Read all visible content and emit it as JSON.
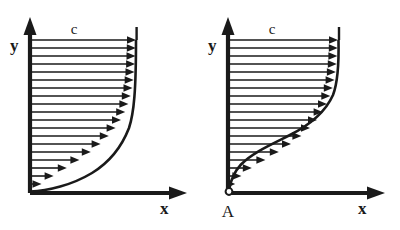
{
  "figure": {
    "background_color": "#ffffff",
    "ink_color": "#1a1a1a",
    "panel_count": 2
  },
  "panels": [
    {
      "id": "left-panel",
      "name": "attached-boundary-layer-profile",
      "origin": {
        "x": 30,
        "y": 193
      },
      "axes": {
        "x": {
          "label": "x",
          "label_x": 160,
          "label_y": 212,
          "start_x": 30,
          "end_x": 185,
          "y": 193
        },
        "y": {
          "label": "y",
          "label_x": 14,
          "label_y": 45,
          "x": 30,
          "start_y": 193,
          "end_y": 22
        }
      },
      "freestream_label": {
        "text": "c",
        "x": 74,
        "y": 33
      },
      "origin_marker": false,
      "origin_marker_label": "",
      "profile_type": "blasius-like",
      "profile_top_x": 136,
      "profile_top_y": 40,
      "line_count": 19,
      "arrow_lengths_fraction": [
        0.06,
        0.16,
        0.3,
        0.44,
        0.56,
        0.66,
        0.74,
        0.81,
        0.865,
        0.905,
        0.934,
        0.955,
        0.97,
        0.98,
        0.988,
        0.993,
        0.996,
        0.998,
        1.0
      ]
    },
    {
      "id": "right-panel",
      "name": "separating-boundary-layer-profile",
      "origin": {
        "x": 228,
        "y": 193
      },
      "axes": {
        "x": {
          "label": "x",
          "label_x": 360,
          "label_y": 212,
          "start_x": 228,
          "end_x": 385,
          "y": 193
        },
        "y": {
          "label": "y",
          "label_x": 212,
          "label_y": 45,
          "x": 228,
          "start_y": 193,
          "end_y": 22
        }
      },
      "freestream_label": {
        "text": "c",
        "x": 272,
        "y": 33
      },
      "origin_marker": true,
      "origin_marker_label": "A",
      "origin_marker_label_x": 221,
      "origin_marker_label_y": 214,
      "profile_type": "s-shaped-inflected",
      "profile_top_x": 338,
      "profile_top_y": 40,
      "line_count": 19,
      "arrow_lengths_fraction": [
        0.02,
        0.05,
        0.13,
        0.26,
        0.4,
        0.52,
        0.62,
        0.7,
        0.77,
        0.83,
        0.875,
        0.912,
        0.94,
        0.96,
        0.975,
        0.985,
        0.992,
        0.997,
        1.0
      ]
    }
  ]
}
